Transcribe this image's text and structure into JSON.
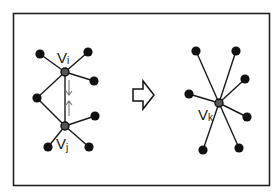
{
  "diagram": {
    "type": "edge-contraction",
    "frame": {
      "x": 13,
      "y": 13,
      "w": 257,
      "h": 173,
      "stroke": "#222222"
    },
    "colors": {
      "node": "#111111",
      "edge": "#1a1a1a",
      "merged_node": "#555555",
      "direction_arrows": "#777777"
    },
    "before": {
      "labels": {
        "vi": "Vi",
        "vj": "Vj"
      },
      "nodes": [
        {
          "id": "vi",
          "x": 65,
          "y": 72,
          "type": "merged"
        },
        {
          "id": "vj",
          "x": 65,
          "y": 126,
          "type": "merged"
        },
        {
          "id": "a",
          "x": 40,
          "y": 54
        },
        {
          "id": "b",
          "x": 88,
          "y": 52
        },
        {
          "id": "c",
          "x": 94,
          "y": 81
        },
        {
          "id": "m",
          "x": 37,
          "y": 98
        },
        {
          "id": "d",
          "x": 95,
          "y": 116
        },
        {
          "id": "e",
          "x": 48,
          "y": 147
        },
        {
          "id": "f",
          "x": 89,
          "y": 147
        }
      ],
      "edges": [
        [
          "vi",
          "a"
        ],
        [
          "vi",
          "b"
        ],
        [
          "vi",
          "c"
        ],
        [
          "vi",
          "m"
        ],
        [
          "vi",
          "vj"
        ],
        [
          "vj",
          "m"
        ],
        [
          "vj",
          "d"
        ],
        [
          "vj",
          "e"
        ],
        [
          "vj",
          "f"
        ]
      ]
    },
    "transform_arrow": {
      "glyph": "hollow-right-arrow"
    },
    "after": {
      "labels": {
        "vk": "Vk"
      },
      "nodes": [
        {
          "id": "vk",
          "x": 219,
          "y": 103,
          "type": "merged"
        },
        {
          "id": "p1",
          "x": 196,
          "y": 51
        },
        {
          "id": "p2",
          "x": 236,
          "y": 51
        },
        {
          "id": "p3",
          "x": 245,
          "y": 79
        },
        {
          "id": "p4",
          "x": 189,
          "y": 94
        },
        {
          "id": "p5",
          "x": 247,
          "y": 117
        },
        {
          "id": "p6",
          "x": 203,
          "y": 150
        },
        {
          "id": "p7",
          "x": 239,
          "y": 148
        }
      ],
      "edges": [
        [
          "vk",
          "p1"
        ],
        [
          "vk",
          "p2"
        ],
        [
          "vk",
          "p3"
        ],
        [
          "vk",
          "p4"
        ],
        [
          "vk",
          "p5"
        ],
        [
          "vk",
          "p6"
        ],
        [
          "vk",
          "p7"
        ]
      ]
    }
  }
}
